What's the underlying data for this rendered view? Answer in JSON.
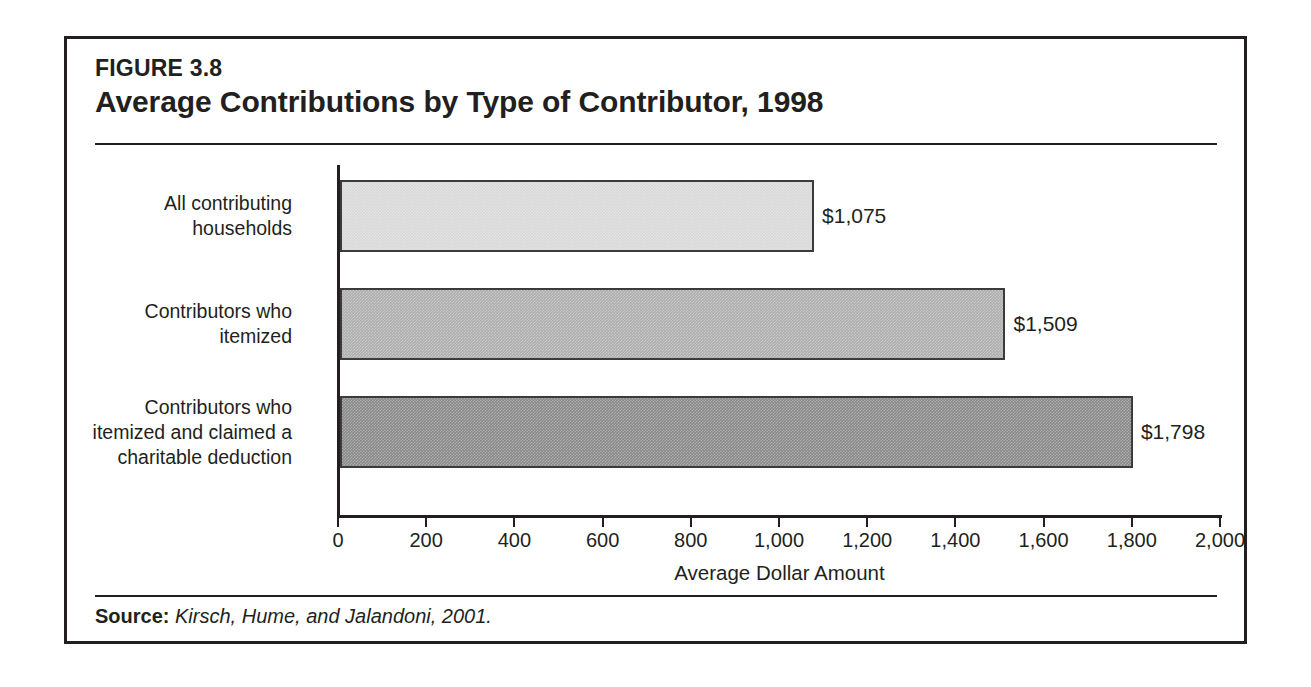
{
  "figure": {
    "number": "FIGURE 3.8",
    "title": "Average Contributions by Type of Contributor, 1998",
    "source_label": "Source:",
    "source_text": "Kirsch, Hume, and Jalandoni, 2001."
  },
  "colors": {
    "frame": "#231f20",
    "text": "#231f20",
    "bar_light": "#d8d8d8",
    "bar_medium": "#aeaeae",
    "bar_dark": "#888888",
    "bar_outline": "#3b3b3b"
  },
  "chart_data": {
    "type": "bar",
    "orientation": "horizontal",
    "title": "Average Contributions by Type of Contributor, 1998",
    "subtitle": "FIGURE 3.8",
    "categories": [
      "All contributing\nhouseholds",
      "Contributors who\nitemized",
      "Contributors who\nitemized and claimed a\ncharitable deduction"
    ],
    "values": [
      1075,
      1509,
      1798
    ],
    "value_labels": [
      "$1,075",
      "$1,509",
      "$1,798"
    ],
    "bar_colors": [
      "#d8d8d8",
      "#aeaeae",
      "#888888"
    ],
    "xlabel": "Average Dollar Amount",
    "ylabel": "",
    "xlim": [
      0,
      2000
    ],
    "xticks": [
      0,
      200,
      400,
      600,
      800,
      1000,
      1200,
      1400,
      1600,
      1800,
      2000
    ],
    "xtick_labels": [
      "0",
      "200",
      "400",
      "600",
      "800",
      "1,000",
      "1,200",
      "1,400",
      "1,600",
      "1,800",
      "2,000"
    ],
    "grid": false,
    "legend": false
  }
}
